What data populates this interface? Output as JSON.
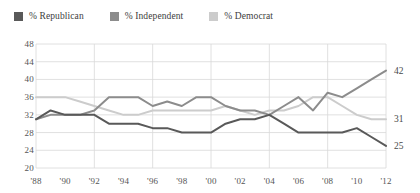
{
  "legend": {
    "items": [
      {
        "label": "% Republican",
        "color": "#595959",
        "key": "republican"
      },
      {
        "label": "% Independent",
        "color": "#8c8c8c",
        "key": "independent"
      },
      {
        "label": "% Democrat",
        "color": "#cccccc",
        "key": "democrat"
      }
    ]
  },
  "end_labels": [
    {
      "text": "42",
      "series": "independent"
    },
    {
      "text": "31",
      "series": "democrat"
    },
    {
      "text": "25",
      "series": "republican"
    }
  ],
  "chart_data": {
    "type": "line",
    "title": "",
    "xlabel": "",
    "ylabel": "",
    "grid": true,
    "legend_position": "top-left",
    "ylim": [
      20,
      48
    ],
    "yticks": [
      48,
      44,
      40,
      36,
      32,
      28,
      24,
      20
    ],
    "xlim": [
      1988,
      2012
    ],
    "xticks": [
      1988,
      1990,
      1992,
      1994,
      1996,
      1998,
      2000,
      2002,
      2004,
      2006,
      2008,
      2010,
      2012
    ],
    "xticklabels": [
      "'88",
      "'90",
      "'92",
      "'94",
      "'96",
      "'98",
      "'00",
      "'02",
      "'04",
      "'06",
      "'08",
      "'10",
      "'12"
    ],
    "x": [
      1988,
      1989,
      1990,
      1991,
      1992,
      1993,
      1994,
      1995,
      1996,
      1997,
      1998,
      1999,
      2000,
      2001,
      2002,
      2003,
      2004,
      2005,
      2006,
      2007,
      2008,
      2009,
      2010,
      2011,
      2012
    ],
    "series": [
      {
        "name": "% Republican",
        "color": "#595959",
        "values": [
          31,
          33,
          32,
          32,
          32,
          30,
          30,
          30,
          29,
          29,
          28,
          28,
          28,
          30,
          31,
          31,
          32,
          30,
          28,
          28,
          28,
          28,
          29,
          27,
          25
        ]
      },
      {
        "name": "% Independent",
        "color": "#8c8c8c",
        "values": [
          31,
          32,
          32,
          32,
          33,
          36,
          36,
          36,
          34,
          35,
          34,
          36,
          36,
          34,
          33,
          33,
          32,
          34,
          36,
          33,
          37,
          36,
          38,
          40,
          42
        ]
      },
      {
        "name": "% Democrat",
        "color": "#cccccc",
        "values": [
          36,
          36,
          36,
          35,
          34,
          33,
          32,
          32,
          33,
          33,
          33,
          33,
          33,
          34,
          33,
          32,
          33,
          33,
          34,
          36,
          36,
          34,
          32,
          31,
          31
        ]
      }
    ]
  }
}
